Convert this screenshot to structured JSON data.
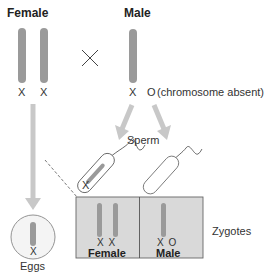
{
  "parents": {
    "female": {
      "title": "Female",
      "chromosomes": [
        "X",
        "X"
      ]
    },
    "cross_symbol": "×",
    "male": {
      "title": "Male",
      "chromosomes": [
        "X",
        "O"
      ],
      "note": "(chromosome absent)"
    }
  },
  "gametes": {
    "sperm_label": "Sperm",
    "sperm": [
      {
        "chromosome": "X"
      },
      {
        "chromosome": "O"
      }
    ],
    "eggs_label": "Eggs",
    "egg_chromosome": "X"
  },
  "zygotes": {
    "label": "Zygotes",
    "cells": [
      {
        "sex": "Female",
        "chromosomes": "X X"
      },
      {
        "sex": "Male",
        "chromosomes": "X O"
      }
    ]
  },
  "colors": {
    "chromosome": "#9a9a9a",
    "arrow": "#c8c8c8",
    "zygote_fill": "#d9d9d9",
    "outline": "#888888"
  }
}
